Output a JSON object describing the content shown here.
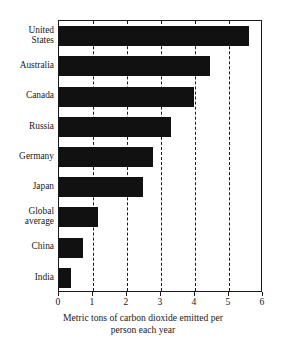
{
  "chart_data": {
    "type": "bar",
    "orientation": "horizontal",
    "title": "",
    "subtitle": "",
    "xlabel": "Metric tons of carbon dioxide emitted per person each year",
    "ylabel": "",
    "categories": [
      "United States",
      "Australia",
      "Canada",
      "Russia",
      "Germany",
      "Japan",
      "Global average",
      "China",
      "India"
    ],
    "values": [
      5.6,
      4.45,
      3.97,
      3.3,
      2.77,
      2.47,
      1.15,
      0.72,
      0.35
    ],
    "xlim": [
      0,
      6
    ],
    "xticks": [
      0,
      1,
      2,
      3,
      4,
      5,
      6
    ],
    "xtick_labels": [
      "0",
      "1",
      "2",
      "3",
      "4",
      "5",
      "6"
    ],
    "gridlines": [
      1,
      2,
      3,
      4,
      5
    ],
    "grid": true,
    "grid_style": "dashed-vertical",
    "legend": "none",
    "bar_color": "#111111",
    "frame_color": "#1a1a1a",
    "background_color": "#ffffff"
  },
  "axis_title": {
    "line1": "Metric tons of carbon dioxide emitted per",
    "line2": "person each year"
  },
  "ylabel_text": [
    "United\nStates",
    "Australia",
    "Canada",
    "Russia",
    "Germany",
    "Japan",
    "Global\naverage",
    "China",
    "India"
  ]
}
